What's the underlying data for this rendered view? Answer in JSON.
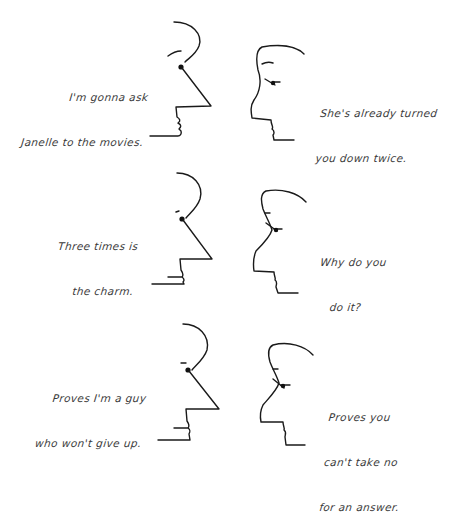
{
  "comic": {
    "panels": [
      {
        "left_speaker": {
          "lines": [
            "I'm gonna ask",
            "Janelle to the movies."
          ]
        },
        "right_speaker": {
          "lines": [
            "She's already turned",
            "you down twice."
          ]
        }
      },
      {
        "left_speaker": {
          "lines": [
            "Three times is",
            "the charm."
          ]
        },
        "right_speaker": {
          "lines": [
            "Why do you",
            "do it?"
          ]
        }
      },
      {
        "left_speaker": {
          "lines": [
            "Proves I'm a guy",
            "who won't give up."
          ]
        },
        "right_speaker": {
          "lines": [
            "Proves you",
            "can't take no",
            "for an answer."
          ]
        }
      }
    ]
  },
  "colors": {
    "background": "#ffffff",
    "ink": "#1a1a1a",
    "text": "#3a3a3a"
  }
}
